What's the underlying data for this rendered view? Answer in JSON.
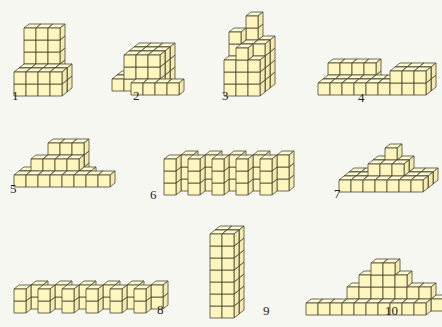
{
  "colors": {
    "front": "#fdf6bf",
    "top": "#fefad6",
    "side": "#f4ebb0",
    "stroke": "#4a4630"
  },
  "cube": {
    "s": 12,
    "dx": 5,
    "dy": 4
  },
  "figures": [
    {
      "label": "1",
      "ox": 14,
      "oy": 96,
      "lx": 12,
      "ly": 88,
      "cubes": [
        [
          0,
          0,
          2
        ],
        [
          1,
          0,
          2
        ],
        [
          2,
          0,
          2
        ],
        [
          0,
          1,
          2
        ],
        [
          1,
          1,
          2
        ],
        [
          2,
          1,
          2
        ],
        [
          0,
          2,
          2
        ],
        [
          1,
          2,
          2
        ],
        [
          2,
          2,
          2
        ],
        [
          0,
          3,
          2
        ],
        [
          1,
          3,
          2
        ],
        [
          2,
          3,
          2
        ],
        [
          0,
          4,
          2
        ],
        [
          1,
          4,
          2
        ],
        [
          2,
          4,
          2
        ],
        [
          0,
          0,
          1
        ],
        [
          1,
          0,
          1
        ],
        [
          2,
          0,
          1
        ],
        [
          3,
          0,
          1
        ],
        [
          0,
          1,
          1
        ],
        [
          1,
          1,
          1
        ],
        [
          2,
          1,
          1
        ],
        [
          3,
          1,
          1
        ],
        [
          0,
          0,
          0
        ],
        [
          1,
          0,
          0
        ],
        [
          2,
          0,
          0
        ],
        [
          3,
          0,
          0
        ],
        [
          0,
          1,
          0
        ],
        [
          1,
          1,
          0
        ],
        [
          2,
          1,
          0
        ],
        [
          3,
          1,
          0
        ]
      ]
    },
    {
      "label": "2",
      "ox": 107,
      "oy": 95,
      "lx": 133,
      "ly": 88,
      "cubes": [
        [
          0,
          0,
          2
        ],
        [
          1,
          0,
          3
        ],
        [
          2,
          0,
          3
        ],
        [
          3,
          0,
          3
        ],
        [
          1,
          1,
          3
        ],
        [
          2,
          1,
          3
        ],
        [
          3,
          1,
          3
        ],
        [
          1,
          2,
          3
        ],
        [
          2,
          2,
          3
        ],
        [
          3,
          2,
          3
        ],
        [
          1,
          0,
          2
        ],
        [
          2,
          0,
          2
        ],
        [
          3,
          0,
          2
        ],
        [
          1,
          1,
          2
        ],
        [
          2,
          1,
          2
        ],
        [
          3,
          1,
          2
        ],
        [
          1,
          2,
          2
        ],
        [
          2,
          2,
          2
        ],
        [
          3,
          2,
          2
        ],
        [
          0,
          0,
          1
        ],
        [
          1,
          0,
          1
        ],
        [
          2,
          0,
          1
        ],
        [
          3,
          0,
          1
        ],
        [
          1,
          1,
          1
        ],
        [
          2,
          1,
          1
        ],
        [
          3,
          1,
          1
        ],
        [
          1,
          2,
          1
        ],
        [
          2,
          2,
          1
        ],
        [
          3,
          2,
          1
        ],
        [
          2,
          0,
          0
        ],
        [
          3,
          0,
          0
        ],
        [
          4,
          0,
          0
        ],
        [
          5,
          0,
          0
        ]
      ]
    },
    {
      "label": "3",
      "ox": 224,
      "oy": 96,
      "lx": 222,
      "ly": 88,
      "cubes": [
        [
          0,
          0,
          2
        ],
        [
          1,
          0,
          2
        ],
        [
          2,
          0,
          2
        ],
        [
          0,
          1,
          2
        ],
        [
          1,
          1,
          2
        ],
        [
          2,
          1,
          2
        ],
        [
          0,
          2,
          2
        ],
        [
          1,
          2,
          2
        ],
        [
          2,
          2,
          2
        ],
        [
          0,
          3,
          2
        ],
        [
          1,
          3,
          2
        ],
        [
          2,
          3,
          2
        ],
        [
          1,
          4,
          2
        ],
        [
          0,
          4,
          1
        ],
        [
          1,
          5,
          2
        ],
        [
          0,
          0,
          1
        ],
        [
          1,
          0,
          1
        ],
        [
          2,
          0,
          1
        ],
        [
          0,
          1,
          1
        ],
        [
          1,
          1,
          1
        ],
        [
          2,
          1,
          1
        ],
        [
          0,
          2,
          1
        ],
        [
          1,
          2,
          1
        ],
        [
          2,
          2,
          1
        ],
        [
          0,
          3,
          1
        ],
        [
          1,
          3,
          1
        ],
        [
          2,
          3,
          1
        ],
        [
          0,
          0,
          0
        ],
        [
          1,
          0,
          0
        ],
        [
          2,
          0,
          0
        ],
        [
          0,
          1,
          0
        ],
        [
          1,
          1,
          0
        ],
        [
          2,
          1,
          0
        ],
        [
          0,
          2,
          0
        ],
        [
          1,
          2,
          0
        ],
        [
          2,
          2,
          0
        ],
        [
          1,
          3,
          0
        ]
      ]
    },
    {
      "label": "4",
      "ox": 318,
      "oy": 95,
      "lx": 358,
      "ly": 90,
      "cubes": [
        [
          0,
          0,
          2
        ],
        [
          1,
          0,
          2
        ],
        [
          2,
          0,
          2
        ],
        [
          3,
          0,
          2
        ],
        [
          0,
          1,
          2
        ],
        [
          1,
          1,
          2
        ],
        [
          2,
          1,
          2
        ],
        [
          3,
          1,
          2
        ],
        [
          0,
          0,
          1
        ],
        [
          1,
          0,
          1
        ],
        [
          2,
          0,
          1
        ],
        [
          3,
          0,
          1
        ],
        [
          4,
          0,
          1
        ],
        [
          5,
          0,
          1
        ],
        [
          6,
          0,
          1
        ],
        [
          7,
          0,
          1
        ],
        [
          8,
          0,
          1
        ],
        [
          0,
          0,
          0
        ],
        [
          1,
          0,
          0
        ],
        [
          2,
          0,
          0
        ],
        [
          3,
          0,
          0
        ],
        [
          4,
          0,
          0
        ],
        [
          5,
          0,
          0
        ],
        [
          6,
          0,
          0
        ],
        [
          7,
          0,
          0
        ],
        [
          8,
          0,
          0
        ],
        [
          6,
          1,
          0
        ],
        [
          7,
          1,
          0
        ],
        [
          8,
          1,
          0
        ],
        [
          8,
          1,
          1
        ],
        [
          7,
          1,
          1
        ],
        [
          6,
          1,
          1
        ]
      ]
    },
    {
      "label": "5",
      "ox": 14,
      "oy": 187,
      "lx": 10,
      "ly": 181,
      "cubes": [
        [
          2,
          0,
          2
        ],
        [
          3,
          0,
          2
        ],
        [
          4,
          0,
          2
        ],
        [
          2,
          1,
          2
        ],
        [
          3,
          1,
          2
        ],
        [
          4,
          1,
          2
        ],
        [
          2,
          2,
          2
        ],
        [
          3,
          2,
          2
        ],
        [
          4,
          2,
          2
        ],
        [
          0,
          0,
          1
        ],
        [
          1,
          0,
          1
        ],
        [
          2,
          0,
          1
        ],
        [
          3,
          0,
          1
        ],
        [
          4,
          0,
          1
        ],
        [
          5,
          0,
          1
        ],
        [
          1,
          1,
          1
        ],
        [
          2,
          1,
          1
        ],
        [
          3,
          1,
          1
        ],
        [
          4,
          1,
          1
        ],
        [
          0,
          0,
          0
        ],
        [
          1,
          0,
          0
        ],
        [
          2,
          0,
          0
        ],
        [
          3,
          0,
          0
        ],
        [
          4,
          0,
          0
        ],
        [
          5,
          0,
          0
        ],
        [
          6,
          0,
          0
        ],
        [
          7,
          0,
          0
        ]
      ]
    },
    {
      "label": "6",
      "ox": 164,
      "oy": 195,
      "lx": 150,
      "ly": 187,
      "cubes": [
        [
          0,
          0,
          0
        ],
        [
          1,
          0,
          1
        ],
        [
          2,
          0,
          0
        ],
        [
          3,
          0,
          1
        ],
        [
          4,
          0,
          0
        ],
        [
          5,
          0,
          1
        ],
        [
          6,
          0,
          0
        ],
        [
          7,
          0,
          1
        ],
        [
          8,
          0,
          0
        ],
        [
          9,
          0,
          1
        ],
        [
          0,
          1,
          0
        ],
        [
          1,
          1,
          1
        ],
        [
          2,
          1,
          0
        ],
        [
          3,
          1,
          1
        ],
        [
          4,
          1,
          0
        ],
        [
          5,
          1,
          1
        ],
        [
          6,
          1,
          0
        ],
        [
          7,
          1,
          1
        ],
        [
          8,
          1,
          0
        ],
        [
          9,
          1,
          1
        ],
        [
          0,
          2,
          0
        ],
        [
          1,
          2,
          1
        ],
        [
          2,
          2,
          0
        ],
        [
          3,
          2,
          1
        ],
        [
          4,
          2,
          0
        ],
        [
          5,
          2,
          1
        ],
        [
          6,
          2,
          0
        ],
        [
          7,
          2,
          1
        ],
        [
          8,
          2,
          0
        ],
        [
          9,
          2,
          1
        ]
      ]
    },
    {
      "label": "7",
      "ox": 339,
      "oy": 192,
      "lx": 334,
      "ly": 186,
      "cubes": [
        [
          0,
          0,
          2
        ],
        [
          1,
          0,
          2
        ],
        [
          2,
          0,
          2
        ],
        [
          3,
          0,
          2
        ],
        [
          4,
          0,
          2
        ],
        [
          5,
          0,
          2
        ],
        [
          6,
          0,
          2
        ],
        [
          0,
          0,
          1
        ],
        [
          1,
          0,
          1
        ],
        [
          2,
          0,
          1
        ],
        [
          3,
          0,
          1
        ],
        [
          4,
          0,
          1
        ],
        [
          5,
          0,
          1
        ],
        [
          6,
          0,
          1
        ],
        [
          0,
          0,
          0
        ],
        [
          1,
          0,
          0
        ],
        [
          2,
          0,
          0
        ],
        [
          3,
          0,
          0
        ],
        [
          4,
          0,
          0
        ],
        [
          5,
          0,
          0
        ],
        [
          6,
          0,
          0
        ],
        [
          2,
          1,
          2
        ],
        [
          3,
          1,
          2
        ],
        [
          4,
          1,
          2
        ],
        [
          2,
          1,
          1
        ],
        [
          3,
          1,
          1
        ],
        [
          4,
          1,
          1
        ],
        [
          3,
          2,
          2
        ]
      ]
    },
    {
      "label": "8",
      "ox": 14,
      "oy": 313,
      "lx": 157,
      "ly": 302,
      "cubes": [
        [
          0,
          0,
          0
        ],
        [
          1,
          0,
          1
        ],
        [
          2,
          0,
          0
        ],
        [
          3,
          0,
          1
        ],
        [
          4,
          0,
          0
        ],
        [
          5,
          0,
          1
        ],
        [
          6,
          0,
          0
        ],
        [
          7,
          0,
          1
        ],
        [
          8,
          0,
          0
        ],
        [
          9,
          0,
          1
        ],
        [
          10,
          0,
          0
        ],
        [
          11,
          0,
          1
        ],
        [
          0,
          1,
          0
        ],
        [
          1,
          1,
          1
        ],
        [
          2,
          1,
          0
        ],
        [
          3,
          1,
          1
        ],
        [
          4,
          1,
          0
        ],
        [
          5,
          1,
          1
        ],
        [
          6,
          1,
          0
        ],
        [
          7,
          1,
          1
        ],
        [
          8,
          1,
          0
        ],
        [
          9,
          1,
          1
        ],
        [
          10,
          1,
          0
        ],
        [
          11,
          1,
          1
        ]
      ]
    },
    {
      "label": "9",
      "ox": 210,
      "oy": 318,
      "lx": 263,
      "ly": 303,
      "cubes": [
        [
          0,
          0,
          1
        ],
        [
          1,
          0,
          1
        ],
        [
          0,
          1,
          1
        ],
        [
          1,
          1,
          1
        ],
        [
          0,
          2,
          1
        ],
        [
          1,
          2,
          1
        ],
        [
          0,
          3,
          1
        ],
        [
          1,
          3,
          1
        ],
        [
          0,
          4,
          1
        ],
        [
          1,
          4,
          1
        ],
        [
          0,
          5,
          1
        ],
        [
          1,
          5,
          1
        ],
        [
          0,
          6,
          1
        ],
        [
          1,
          6,
          1
        ],
        [
          0,
          0,
          0
        ],
        [
          1,
          0,
          0
        ],
        [
          0,
          1,
          0
        ],
        [
          1,
          1,
          0
        ],
        [
          0,
          2,
          0
        ],
        [
          1,
          2,
          0
        ],
        [
          0,
          3,
          0
        ],
        [
          1,
          3,
          0
        ],
        [
          0,
          4,
          0
        ],
        [
          1,
          4,
          0
        ],
        [
          0,
          5,
          0
        ],
        [
          1,
          5,
          0
        ],
        [
          0,
          6,
          0
        ],
        [
          1,
          6,
          0
        ]
      ]
    },
    {
      "label": "10",
      "ox": 306,
      "oy": 315,
      "lx": 385,
      "ly": 303,
      "cubes": [
        [
          3,
          0,
          1
        ],
        [
          4,
          0,
          1
        ],
        [
          5,
          0,
          1
        ],
        [
          6,
          0,
          1
        ],
        [
          7,
          0,
          1
        ],
        [
          8,
          0,
          1
        ],
        [
          9,
          0,
          1
        ],
        [
          10,
          0,
          1
        ],
        [
          3,
          1,
          1
        ],
        [
          4,
          1,
          1
        ],
        [
          5,
          1,
          1
        ],
        [
          6,
          1,
          1
        ],
        [
          7,
          1,
          1
        ],
        [
          8,
          1,
          1
        ],
        [
          9,
          1,
          1
        ],
        [
          4,
          2,
          1
        ],
        [
          5,
          2,
          1
        ],
        [
          6,
          2,
          1
        ],
        [
          7,
          2,
          1
        ],
        [
          5,
          3,
          1
        ],
        [
          6,
          3,
          1
        ],
        [
          0,
          0,
          0
        ],
        [
          1,
          0,
          0
        ],
        [
          2,
          0,
          0
        ],
        [
          3,
          0,
          0
        ],
        [
          4,
          0,
          0
        ],
        [
          5,
          0,
          0
        ],
        [
          6,
          0,
          0
        ],
        [
          7,
          0,
          0
        ],
        [
          8,
          0,
          0
        ],
        [
          9,
          0,
          0
        ]
      ]
    }
  ]
}
